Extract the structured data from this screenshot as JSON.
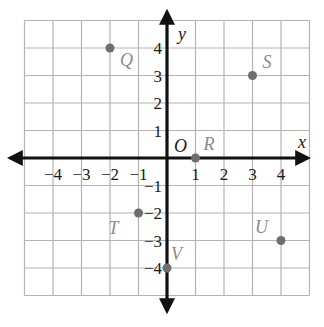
{
  "chart_data": {
    "type": "scatter",
    "title": "",
    "xlabel": "x",
    "ylabel": "y",
    "xlim": [
      -5,
      5
    ],
    "ylim": [
      -5,
      5
    ],
    "grid": true,
    "x_ticks": [
      -4,
      -3,
      -2,
      -1,
      1,
      2,
      3,
      4
    ],
    "y_ticks": [
      4,
      3,
      2,
      1,
      -1,
      -2,
      -3,
      -4
    ],
    "x_tick_labels": [
      "−4",
      "−3",
      "−2",
      "−1",
      "1",
      "2",
      "3",
      "4"
    ],
    "y_tick_labels": [
      "4",
      "3",
      "2",
      "1",
      "−1",
      "−2",
      "−3",
      "−4"
    ],
    "origin_label": "O",
    "points": [
      {
        "label": "Q",
        "x": -2,
        "y": 4
      },
      {
        "label": "S",
        "x": 3,
        "y": 3
      },
      {
        "label": "R",
        "x": 1,
        "y": 0
      },
      {
        "label": "T",
        "x": -1,
        "y": -2
      },
      {
        "label": "U",
        "x": 4,
        "y": -3
      },
      {
        "label": "V",
        "x": 0,
        "y": -4
      }
    ],
    "colors": {
      "grid": "#b4b4b4",
      "axis": "#111111",
      "point": "#6e6e6e",
      "point_label": "#8a8a8a"
    }
  }
}
